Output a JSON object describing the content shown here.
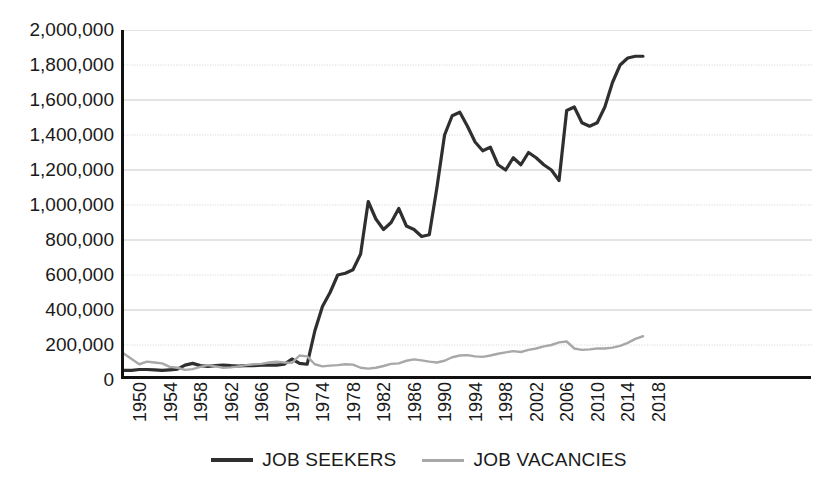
{
  "chart_data": {
    "type": "line",
    "title": "",
    "subtitle": "",
    "xlabel": "",
    "ylabel": "",
    "xlim": [
      1950,
      2018
    ],
    "ylim": [
      0,
      2000000
    ],
    "grid": true,
    "legend_position": "bottom-center",
    "y_ticks": [
      0,
      200000,
      400000,
      600000,
      800000,
      1000000,
      1200000,
      1400000,
      1600000,
      1800000,
      2000000
    ],
    "y_tick_labels": [
      "0",
      "200,000",
      "400,000",
      "600,000",
      "800,000",
      "1,000,000",
      "1,200,000",
      "1,400,000",
      "1,600,000",
      "1,800,000",
      "2,000,000"
    ],
    "x_ticks": [
      1950,
      1954,
      1958,
      1962,
      1966,
      1970,
      1974,
      1978,
      1982,
      1986,
      1990,
      1994,
      1998,
      2002,
      2006,
      2010,
      2014,
      2018
    ],
    "x_tick_labels": [
      "1950",
      "1954",
      "1958",
      "1962",
      "1966",
      "1970",
      "1974",
      "1978",
      "1982",
      "1986",
      "1990",
      "1994",
      "1998",
      "2002",
      "2006",
      "2010",
      "2014",
      "2018"
    ],
    "x": [
      1950,
      1951,
      1952,
      1953,
      1954,
      1955,
      1956,
      1957,
      1958,
      1959,
      1960,
      1961,
      1962,
      1963,
      1964,
      1965,
      1966,
      1967,
      1968,
      1969,
      1970,
      1971,
      1972,
      1973,
      1974,
      1975,
      1976,
      1977,
      1978,
      1979,
      1980,
      1981,
      1982,
      1983,
      1984,
      1985,
      1986,
      1987,
      1988,
      1989,
      1990,
      1991,
      1992,
      1993,
      1994,
      1995,
      1996,
      1997,
      1998,
      1999,
      2000,
      2001,
      2002,
      2003,
      2004,
      2005,
      2006,
      2007,
      2008,
      2009,
      2010,
      2011,
      2012,
      2013,
      2014,
      2015,
      2016,
      2017,
      2018
    ],
    "series": [
      {
        "name": "JOB SEEKERS",
        "color": "#2f2f2f",
        "style": "solid",
        "width": 3.2,
        "values": [
          55000,
          55000,
          60000,
          60000,
          58000,
          55000,
          58000,
          62000,
          85000,
          95000,
          82000,
          78000,
          82000,
          85000,
          82000,
          80000,
          82000,
          82000,
          85000,
          85000,
          85000,
          90000,
          120000,
          95000,
          90000,
          280000,
          420000,
          500000,
          600000,
          610000,
          630000,
          720000,
          1020000,
          920000,
          860000,
          900000,
          980000,
          880000,
          860000,
          820000,
          830000,
          1100000,
          1400000,
          1510000,
          1530000,
          1450000,
          1360000,
          1310000,
          1330000,
          1230000,
          1200000,
          1270000,
          1230000,
          1300000,
          1270000,
          1230000,
          1200000,
          1140000,
          1540000,
          1560000,
          1470000,
          1450000,
          1470000,
          1560000,
          1700000,
          1800000,
          1840000,
          1850000,
          1850000
        ]
      },
      {
        "name": "JOB VACANCIES",
        "color": "#a8a8a8",
        "style": "solid",
        "width": 2.4,
        "values": [
          150000,
          120000,
          90000,
          105000,
          100000,
          95000,
          75000,
          70000,
          58000,
          62000,
          75000,
          85000,
          78000,
          70000,
          72000,
          78000,
          85000,
          90000,
          92000,
          100000,
          105000,
          100000,
          98000,
          140000,
          135000,
          90000,
          78000,
          82000,
          85000,
          90000,
          88000,
          70000,
          65000,
          70000,
          80000,
          92000,
          95000,
          110000,
          118000,
          112000,
          105000,
          100000,
          110000,
          130000,
          140000,
          142000,
          135000,
          132000,
          140000,
          150000,
          158000,
          165000,
          160000,
          172000,
          180000,
          192000,
          200000,
          215000,
          220000,
          180000,
          172000,
          175000,
          180000,
          180000,
          185000,
          195000,
          212000,
          235000,
          250000
        ]
      }
    ]
  }
}
